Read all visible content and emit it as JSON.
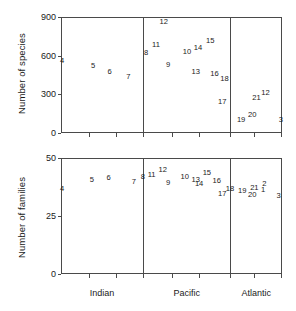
{
  "figure": {
    "categories": [
      "Indian",
      "Pacific",
      "Atlantic"
    ]
  },
  "chart_data": [
    {
      "type": "scatter",
      "title": "",
      "ylabel": "Number of species",
      "xlabel": "",
      "ylim": [
        0,
        900
      ],
      "yticks": [
        0,
        300,
        600,
        900
      ],
      "ytick_labels": [
        "0",
        "300",
        "600",
        "900"
      ],
      "grid": false,
      "legend": "none",
      "x_categories": [
        "Indian",
        "Pacific",
        "Atlantic"
      ],
      "point_labels_are_data": true,
      "points": [
        {
          "label": "4",
          "x": 0.5,
          "y": 560
        },
        {
          "label": "5",
          "x": 14.5,
          "y": 520
        },
        {
          "label": "6",
          "x": 22.0,
          "y": 470
        },
        {
          "label": "7",
          "x": 30.5,
          "y": 437
        },
        {
          "label": "8",
          "x": 38.5,
          "y": 620
        },
        {
          "label": "11",
          "x": 43.0,
          "y": 680
        },
        {
          "label": "12",
          "x": 46.5,
          "y": 860
        },
        {
          "label": "9",
          "x": 48.5,
          "y": 528
        },
        {
          "label": "10",
          "x": 57.0,
          "y": 625
        },
        {
          "label": "14",
          "x": 62.0,
          "y": 660
        },
        {
          "label": "15",
          "x": 67.5,
          "y": 713
        },
        {
          "label": "13",
          "x": 61.0,
          "y": 470
        },
        {
          "label": "16",
          "x": 69.5,
          "y": 460
        },
        {
          "label": "18",
          "x": 74.0,
          "y": 420
        },
        {
          "label": "17",
          "x": 73.0,
          "y": 243
        },
        {
          "label": "19",
          "x": 81.5,
          "y": 100
        },
        {
          "label": "20",
          "x": 86.5,
          "y": 140
        },
        {
          "label": "21",
          "x": 88.5,
          "y": 273
        },
        {
          "label": "12",
          "x": 92.5,
          "y": 310
        },
        {
          "label": "3",
          "x": 99.5,
          "y": 100
        }
      ]
    },
    {
      "type": "scatter",
      "title": "",
      "ylabel": "Number of families",
      "xlabel": "",
      "ylim": [
        0,
        50
      ],
      "yticks": [
        0,
        25,
        50
      ],
      "ytick_labels": [
        "0",
        "25",
        "50"
      ],
      "grid": false,
      "legend": "none",
      "x_categories": [
        "Indian",
        "Pacific",
        "Atlantic"
      ],
      "point_labels_are_data": true,
      "points": [
        {
          "label": "4",
          "x": 0.5,
          "y": 36.5
        },
        {
          "label": "5",
          "x": 14.0,
          "y": 40.5
        },
        {
          "label": "6",
          "x": 21.5,
          "y": 41.5
        },
        {
          "label": "7",
          "x": 33.0,
          "y": 39.5
        },
        {
          "label": "8",
          "x": 37.0,
          "y": 41.8
        },
        {
          "label": "11",
          "x": 41.0,
          "y": 42.6
        },
        {
          "label": "12",
          "x": 46.0,
          "y": 45.0
        },
        {
          "label": "9",
          "x": 48.5,
          "y": 39.3
        },
        {
          "label": "10",
          "x": 56.0,
          "y": 42.0
        },
        {
          "label": "13",
          "x": 61.0,
          "y": 40.5
        },
        {
          "label": "15",
          "x": 66.0,
          "y": 43.4
        },
        {
          "label": "14",
          "x": 62.5,
          "y": 38.6
        },
        {
          "label": "16",
          "x": 70.5,
          "y": 40.3
        },
        {
          "label": "18",
          "x": 76.5,
          "y": 36.5
        },
        {
          "label": "17",
          "x": 73.0,
          "y": 34.6
        },
        {
          "label": "19",
          "x": 82.0,
          "y": 35.6
        },
        {
          "label": "21",
          "x": 87.5,
          "y": 36.9
        },
        {
          "label": "20",
          "x": 86.5,
          "y": 34.2
        },
        {
          "label": "2",
          "x": 92.0,
          "y": 39.0
        },
        {
          "label": "1",
          "x": 91.5,
          "y": 36.2
        },
        {
          "label": "3",
          "x": 98.5,
          "y": 33.8
        }
      ]
    }
  ]
}
